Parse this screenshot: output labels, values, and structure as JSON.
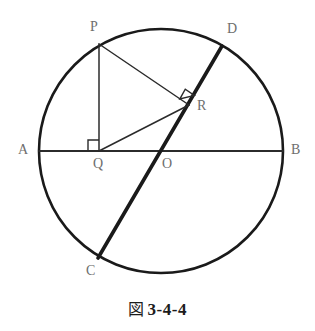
{
  "figure": {
    "caption_symbol": "図",
    "caption_number": "3-4-4",
    "caption_full": "図 3-4-4",
    "stroke_color": "#1a1a1a",
    "thin_stroke_color": "#2b2b2b",
    "label_color": "#6e6e6e",
    "background_color": "#ffffff"
  },
  "geometry": {
    "circle": {
      "name": "main-circle",
      "cx": 161,
      "cy": 151,
      "r": 122,
      "stroke_width": 2.6
    },
    "points": {
      "A": {
        "x": 39,
        "y": 151,
        "label": "A",
        "label_x": 18,
        "label_y": 143
      },
      "B": {
        "x": 283,
        "y": 151,
        "label": "B",
        "label_x": 291,
        "label_y": 143
      },
      "C": {
        "x": 98,
        "y": 258,
        "label": "C",
        "label_x": 86,
        "label_y": 264
      },
      "D": {
        "x": 222,
        "y": 46,
        "label": "D",
        "label_x": 227,
        "label_y": 22
      },
      "O": {
        "x": 161,
        "y": 151,
        "label": "O",
        "label_x": 162,
        "label_y": 157
      },
      "P": {
        "x": 99,
        "y": 44,
        "label": "P",
        "label_x": 90,
        "label_y": 20
      },
      "Q": {
        "x": 99,
        "y": 151,
        "label": "Q",
        "label_x": 93,
        "label_y": 157
      },
      "R": {
        "x": 189,
        "y": 105,
        "label": "R",
        "label_x": 197,
        "label_y": 99
      }
    },
    "segments": [
      {
        "name": "diameter-AB",
        "from": "A",
        "to": "B",
        "width": 2.0,
        "kind": "thin"
      },
      {
        "name": "chord-CD",
        "from": "C",
        "to": "D",
        "width": 3.6,
        "kind": "bold"
      },
      {
        "name": "segment-PQ",
        "from": "P",
        "to": "Q",
        "width": 1.5,
        "kind": "thin"
      },
      {
        "name": "segment-PR",
        "from": "P",
        "to": "R",
        "width": 1.5,
        "kind": "thin"
      },
      {
        "name": "segment-QR",
        "from": "Q",
        "to": "R",
        "width": 1.5,
        "kind": "thin"
      }
    ],
    "right_angles": [
      {
        "name": "right-angle-at-Q",
        "at": "Q",
        "size": 11
      },
      {
        "name": "right-angle-at-R",
        "at": "R",
        "size": 11
      }
    ]
  }
}
